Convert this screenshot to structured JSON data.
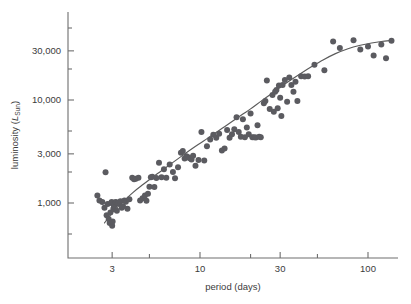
{
  "chart_data": {
    "type": "scatter",
    "title": "",
    "xlabel": "period (days)",
    "ylabel": "luminosity (L_Sun)",
    "ylabel_parts": {
      "prefix": "luminosity (",
      "italic": "L",
      "sub": "Sun",
      "suffix": ")"
    },
    "xscale": "log",
    "yscale": "log",
    "xlim": [
      2.1,
      160
    ],
    "ylim": [
      330,
      62000
    ],
    "grid": false,
    "legend": null,
    "xticks": [
      3,
      10,
      30,
      100
    ],
    "xtick_labels": [
      "3",
      "10",
      "30",
      "100"
    ],
    "xminor_ticks": [
      5,
      20,
      50
    ],
    "yticks": [
      1000,
      3000,
      10000,
      30000
    ],
    "ytick_labels": [
      "1,000",
      "3,000",
      "10,000",
      "30,000"
    ],
    "yminor_ticks": [
      500,
      2000,
      5000,
      20000,
      50000
    ],
    "marker_color": "#5b5b60",
    "curve_color": "#5a5a5a",
    "axis_color": "#6e6e6e",
    "text_color": "#3b3b3b",
    "marker_size_px": 3.0,
    "n_points": 118,
    "points": [
      [
        2.45,
        1180
      ],
      [
        2.52,
        1060
      ],
      [
        2.62,
        1020
      ],
      [
        2.7,
        900
      ],
      [
        2.74,
        1990
      ],
      [
        2.78,
        760
      ],
      [
        2.82,
        980
      ],
      [
        2.86,
        700
      ],
      [
        2.9,
        640
      ],
      [
        2.93,
        810
      ],
      [
        2.96,
        1000
      ],
      [
        2.98,
        1020
      ],
      [
        3.0,
        600
      ],
      [
        3.02,
        660
      ],
      [
        3.05,
        880
      ],
      [
        3.08,
        930
      ],
      [
        3.12,
        1010
      ],
      [
        3.16,
        1020
      ],
      [
        3.2,
        840
      ],
      [
        3.24,
        990
      ],
      [
        3.3,
        1000
      ],
      [
        3.36,
        1040
      ],
      [
        3.42,
        900
      ],
      [
        3.48,
        930
      ],
      [
        3.55,
        1060
      ],
      [
        3.62,
        1030
      ],
      [
        3.7,
        880
      ],
      [
        3.8,
        1090
      ],
      [
        3.95,
        1760
      ],
      [
        4.05,
        1700
      ],
      [
        4.15,
        1720
      ],
      [
        4.3,
        1760
      ],
      [
        4.4,
        1060
      ],
      [
        4.55,
        1110
      ],
      [
        4.7,
        1180
      ],
      [
        4.8,
        1050
      ],
      [
        4.9,
        1230
      ],
      [
        5.0,
        1440
      ],
      [
        5.1,
        1780
      ],
      [
        5.2,
        1800
      ],
      [
        5.35,
        1430
      ],
      [
        5.5,
        1750
      ],
      [
        5.7,
        2460
      ],
      [
        5.9,
        1780
      ],
      [
        6.1,
        2130
      ],
      [
        6.3,
        1760
      ],
      [
        6.6,
        2370
      ],
      [
        6.9,
        2000
      ],
      [
        7.1,
        1740
      ],
      [
        7.4,
        2220
      ],
      [
        7.7,
        3080
      ],
      [
        7.9,
        3200
      ],
      [
        8.1,
        2700
      ],
      [
        8.3,
        2850
      ],
      [
        8.5,
        2780
      ],
      [
        8.7,
        2720
      ],
      [
        8.9,
        2640
      ],
      [
        9.1,
        2880
      ],
      [
        9.4,
        2300
      ],
      [
        9.8,
        2620
      ],
      [
        10.2,
        4900
      ],
      [
        10.6,
        2580
      ],
      [
        11.0,
        3560
      ],
      [
        11.5,
        4130
      ],
      [
        12.0,
        4600
      ],
      [
        12.5,
        4300
      ],
      [
        13.0,
        4700
      ],
      [
        13.5,
        3230
      ],
      [
        14.0,
        3380
      ],
      [
        14.5,
        5100
      ],
      [
        15.0,
        4300
      ],
      [
        15.5,
        4650
      ],
      [
        16.0,
        5200
      ],
      [
        16.5,
        6800
      ],
      [
        17.0,
        4900
      ],
      [
        17.5,
        4400
      ],
      [
        18.0,
        6500
      ],
      [
        18.5,
        4350
      ],
      [
        19.0,
        5400
      ],
      [
        19.5,
        4650
      ],
      [
        20.0,
        7400
      ],
      [
        20.5,
        4350
      ],
      [
        21.0,
        4350
      ],
      [
        21.5,
        4320
      ],
      [
        22.0,
        5700
      ],
      [
        22.5,
        4400
      ],
      [
        23.0,
        4350
      ],
      [
        24.0,
        9300
      ],
      [
        24.5,
        9800
      ],
      [
        25.0,
        15500
      ],
      [
        26.0,
        8200
      ],
      [
        27.0,
        11200
      ],
      [
        27.5,
        7700
      ],
      [
        28.0,
        12000
      ],
      [
        28.5,
        12500
      ],
      [
        29.0,
        8300
      ],
      [
        29.5,
        13800
      ],
      [
        30.0,
        10500
      ],
      [
        30.5,
        7000
      ],
      [
        31.0,
        14000
      ],
      [
        32.0,
        15600
      ],
      [
        33.0,
        9600
      ],
      [
        34.0,
        16500
      ],
      [
        35.0,
        14000
      ],
      [
        36.0,
        12000
      ],
      [
        37.0,
        15000
      ],
      [
        38.0,
        9800
      ],
      [
        40.0,
        17000
      ],
      [
        42.0,
        16900
      ],
      [
        44.0,
        17000
      ],
      [
        48.0,
        22000
      ],
      [
        55.0,
        19500
      ],
      [
        62.0,
        37000
      ],
      [
        68.0,
        32000
      ],
      [
        82.0,
        38000
      ],
      [
        90.0,
        31000
      ],
      [
        100.0,
        33000
      ],
      [
        108.0,
        27000
      ],
      [
        120.0,
        34500
      ],
      [
        128.0,
        25500
      ],
      [
        138.0,
        37500
      ]
    ],
    "fit_curve_note": "smooth monotonic fit through scatter, flattening at long periods",
    "fit_curve": [
      [
        2.7,
        640
      ],
      [
        3.0,
        800
      ],
      [
        3.4,
        990
      ],
      [
        4.0,
        1270
      ],
      [
        4.6,
        1520
      ],
      [
        5.3,
        1810
      ],
      [
        6.1,
        2140
      ],
      [
        7.0,
        2520
      ],
      [
        8.0,
        2950
      ],
      [
        9.0,
        3380
      ],
      [
        10.5,
        4000
      ],
      [
        12.0,
        4650
      ],
      [
        14.0,
        5500
      ],
      [
        16.0,
        6400
      ],
      [
        18.0,
        7300
      ],
      [
        20.0,
        8200
      ],
      [
        23.0,
        9700
      ],
      [
        26.0,
        11200
      ],
      [
        30.0,
        13300
      ],
      [
        34.0,
        15300
      ],
      [
        40.0,
        18200
      ],
      [
        46.0,
        21000
      ],
      [
        54.0,
        24500
      ],
      [
        64.0,
        28200
      ],
      [
        76.0,
        31500
      ],
      [
        90.0,
        34000
      ],
      [
        105.0,
        35800
      ],
      [
        120.0,
        37000
      ],
      [
        138.0,
        37800
      ]
    ]
  },
  "geometry": {
    "plot_left_px": 68,
    "plot_right_px": 398,
    "plot_top_px": 12,
    "plot_bottom_px": 258,
    "x_ref_value": 10,
    "x_ref_px": 200,
    "x_decade_px": 168,
    "y_ref_value": 1000,
    "y_ref_px": 203,
    "y_decade_px": 103
  }
}
